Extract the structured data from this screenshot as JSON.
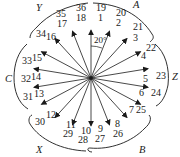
{
  "diagram": {
    "type": "slot-emf-star-diagram",
    "center": {
      "x": 91,
      "y": 78
    },
    "slot_angle_deg": 20,
    "angle_label": "20°",
    "line_color": "#1a1a1a",
    "phasors": [
      {
        "inner": "1",
        "outer": "19",
        "angle": 90
      },
      {
        "inner": "2",
        "outer": "20",
        "angle": 70
      },
      {
        "inner": "3",
        "outer": "21",
        "angle": 50
      },
      {
        "inner": "4",
        "outer": "22",
        "angle": 30
      },
      {
        "inner": "5",
        "outer": "23",
        "angle": 10
      },
      {
        "inner": "6",
        "outer": "24",
        "angle": -10
      },
      {
        "inner": "7",
        "outer": "25",
        "angle": -30
      },
      {
        "inner": "8",
        "outer": "26",
        "angle": -50
      },
      {
        "inner": "9",
        "outer": "27",
        "angle": -70
      },
      {
        "inner": "10",
        "outer": "28",
        "angle": -90
      },
      {
        "inner": "11",
        "outer": "29",
        "angle": -110
      },
      {
        "inner": "12",
        "outer": "30",
        "angle": -130
      },
      {
        "inner": "13",
        "outer": "31",
        "angle": -150
      },
      {
        "inner": "14",
        "outer": "32",
        "angle": -170
      },
      {
        "inner": "15",
        "outer": "33",
        "angle": 170
      },
      {
        "inner": "16",
        "outer": "34",
        "angle": 150
      },
      {
        "inner": "17",
        "outer": "35",
        "angle": 130
      },
      {
        "inner": "18",
        "outer": "36",
        "angle": 110
      }
    ],
    "phase_bands": [
      {
        "label": "A",
        "slots": [
          "1",
          "2",
          "3",
          "19",
          "20",
          "21"
        ]
      },
      {
        "label": "Z",
        "slots": [
          "4",
          "5",
          "6",
          "22",
          "23",
          "24"
        ]
      },
      {
        "label": "B",
        "slots": [
          "7",
          "8",
          "9",
          "25",
          "26",
          "27"
        ]
      },
      {
        "label": "X",
        "slots": [
          "10",
          "11",
          "12",
          "28",
          "29",
          "30"
        ]
      },
      {
        "label": "C",
        "slots": [
          "13",
          "14",
          "15",
          "31",
          "32",
          "33"
        ]
      },
      {
        "label": "Y",
        "slots": [
          "16",
          "17",
          "18",
          "34",
          "35",
          "36"
        ]
      }
    ]
  }
}
